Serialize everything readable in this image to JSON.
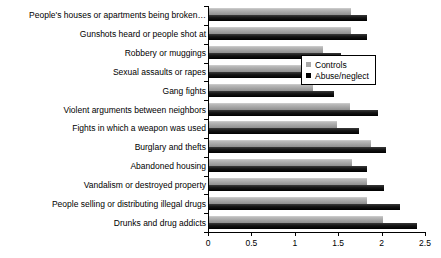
{
  "chart_data": {
    "type": "bar",
    "orientation": "horizontal",
    "title": "",
    "xlabel": "",
    "ylabel": "",
    "xlim": [
      0,
      2.5
    ],
    "xticks": [
      0,
      0.5,
      1,
      1.5,
      2,
      2.5
    ],
    "xticklabels": [
      "0",
      "0.5",
      "1",
      "1.5",
      "2",
      "2.5"
    ],
    "grid": false,
    "legend_position": "center-right",
    "categories": [
      "People's houses or apartments being broken…",
      "Gunshots heard or people shot at",
      "Robbery or muggings",
      "Sexual assaults or rapes",
      "Gang fights",
      "Violent arguments between neighbors",
      "Fights in which a weapon was used",
      "Burglary and thefts",
      "Abandoned housing",
      "Vandalism or destroyed property",
      "People selling or distributing illegal drugs",
      "Drunks and drug addicts"
    ],
    "series": [
      {
        "name": "Controls",
        "color": "#a8a8a8",
        "values": [
          1.65,
          1.65,
          1.32,
          1.13,
          1.21,
          1.64,
          1.49,
          1.88,
          1.66,
          1.83,
          1.83,
          2.02
        ]
      },
      {
        "name": "Abuse/neglect",
        "color": "#000000",
        "values": [
          1.83,
          1.83,
          1.53,
          1.24,
          1.45,
          1.96,
          1.74,
          2.05,
          1.83,
          2.03,
          2.21,
          2.41
        ]
      }
    ]
  },
  "legend": {
    "items": [
      {
        "label": "Controls"
      },
      {
        "label": "Abuse/neglect"
      }
    ]
  }
}
